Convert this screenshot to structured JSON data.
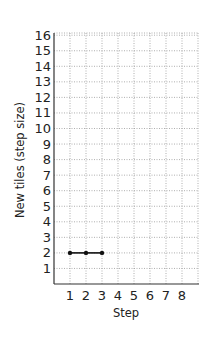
{
  "chart_data": {
    "type": "line",
    "title": "",
    "xlabel": "Step",
    "ylabel": "New tiles (step size)",
    "x": [
      1,
      2,
      3
    ],
    "series": [
      {
        "name": "New tiles",
        "values": [
          2,
          2,
          2
        ],
        "color": "#111111"
      }
    ],
    "xticks": [
      1,
      2,
      3,
      4,
      5,
      6,
      7,
      8
    ],
    "yticks": [
      1,
      2,
      3,
      4,
      5,
      6,
      7,
      8,
      9,
      10,
      11,
      12,
      13,
      14,
      15,
      16
    ],
    "xlim": [
      0,
      9
    ],
    "ylim": [
      0,
      17
    ],
    "grid": true,
    "legend": "none"
  },
  "labels": {
    "xlabel": "Step",
    "ylabel": "New tiles (step size)"
  }
}
